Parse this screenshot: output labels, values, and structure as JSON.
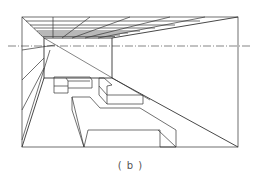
{
  "figure": {
    "caption": "( b )",
    "line_color": "#333333",
    "horizon_style": "dash-dot"
  }
}
